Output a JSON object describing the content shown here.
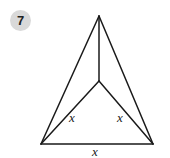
{
  "problem": {
    "number": "7",
    "badge_color": "#d9d9d9"
  },
  "figure": {
    "stroke_color": "#1a1a1a",
    "vertices": {
      "apex": [
        99,
        16
      ],
      "interior": [
        99,
        81
      ],
      "bottom_left": [
        41,
        144
      ],
      "bottom_right": [
        153,
        144
      ]
    },
    "labels": {
      "left_segment": "x",
      "right_segment": "x",
      "bottom_segment": "x"
    }
  }
}
